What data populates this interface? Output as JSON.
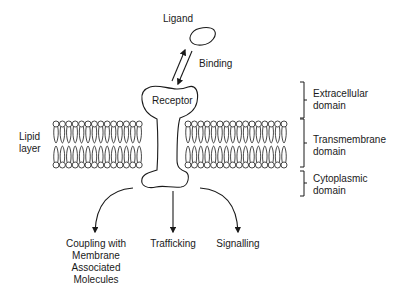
{
  "diagram": {
    "labels": {
      "ligand": "Ligand",
      "binding": "Binding",
      "receptor": "Receptor",
      "lipid_layer": [
        "Lipid",
        "layer"
      ],
      "domains": [
        {
          "id": "extracellular",
          "lines": [
            "Extracellular",
            "domain"
          ]
        },
        {
          "id": "transmembrane",
          "lines": [
            "Transmembrane",
            "domain"
          ]
        },
        {
          "id": "cytoplasmic",
          "lines": [
            "Cytoplasmic",
            "domain"
          ]
        }
      ],
      "outcomes": [
        {
          "id": "coupling",
          "lines": [
            "Coupling with",
            "Membrane",
            "Associated",
            "Molecules"
          ]
        },
        {
          "id": "trafficking",
          "lines": [
            "Trafficking"
          ]
        },
        {
          "id": "signalling",
          "lines": [
            "Signalling"
          ]
        }
      ]
    },
    "colors": {
      "stroke": "#1a1a1a",
      "background": "#ffffff"
    },
    "membrane": {
      "x_start": 53,
      "x_end": 291,
      "gap_start": 148,
      "gap_end": 185,
      "top_head_y": 124,
      "bottom_head_y": 165,
      "head_radius": 3,
      "head_spacing": 6.4
    }
  }
}
